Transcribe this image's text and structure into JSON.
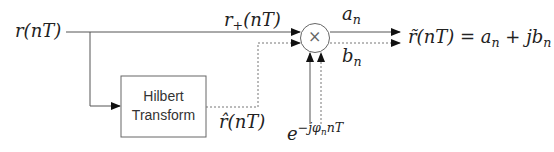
{
  "diagram": {
    "input": {
      "label": "r(nT)"
    },
    "upper_path": {
      "label_base": "r",
      "label_sub": "+",
      "label_tail": "(nT)"
    },
    "hilbert_block": {
      "line1": "Hilbert",
      "line2": "Transform"
    },
    "hilbert_output": {
      "label": "r̂(nT)"
    },
    "multiplier": {
      "symbol": "×"
    },
    "outputs": {
      "real": {
        "base": "a",
        "sub": "n"
      },
      "imag": {
        "base": "b",
        "sub": "n"
      }
    },
    "result": {
      "lhs": "r̃(nT) = ",
      "a": "a",
      "a_sub": "n",
      "plus": " + j",
      "b": "b",
      "b_sub": "n"
    },
    "oscillator": {
      "base": "e",
      "exp_pre": "−jφ",
      "exp_sub": "n",
      "exp_post": "nT"
    },
    "colors": {
      "solid_line": "#555555",
      "dotted_line": "#777777",
      "arrow": "#111111",
      "box_border": "#666666"
    }
  }
}
